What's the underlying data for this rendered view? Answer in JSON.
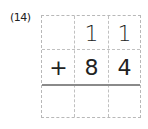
{
  "problem": {
    "label": "(14)",
    "rows": [
      [
        "",
        "1",
        "1"
      ],
      [
        "+",
        "8",
        "4"
      ],
      [
        "",
        "",
        ""
      ]
    ]
  }
}
